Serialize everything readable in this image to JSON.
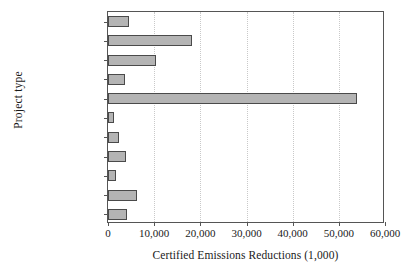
{
  "chart_data": {
    "type": "bar",
    "orientation": "horizontal",
    "title": "",
    "xlabel": "Certified Emissions Reductions (1,000)",
    "ylabel": "Project type",
    "categories": [
      "Wind",
      "N2O",
      "Landfill gas",
      "Hydro",
      "HFCs",
      "Geothermal",
      "Fugitive",
      "EE industry",
      "Cement",
      "Biomass energy",
      "Agriculture"
    ],
    "category_labels_html": [
      "Wind",
      "N<sub>2</sub>O",
      "Landfill gas",
      "Hydro",
      "HFCs",
      "Geothermal",
      "Fugitive",
      "EE industry",
      "Cement",
      "Biomass energy",
      "Agriculture"
    ],
    "values": [
      4500,
      18200,
      10300,
      3600,
      54000,
      1200,
      2300,
      3800,
      1800,
      6200,
      4100
    ],
    "xlim": [
      0,
      60000
    ],
    "xticks": [
      0,
      10000,
      20000,
      30000,
      40000,
      50000,
      60000
    ],
    "xtick_labels": [
      "0",
      "10,000",
      "20,000",
      "30,000",
      "40,000",
      "50,000",
      "60,000"
    ],
    "grid": "vertical-dotted",
    "legend": "none",
    "bar_fill_color": "#b4b4b4",
    "bar_edge_color": "#4a4a4a",
    "gridline_color": "#c9c9c9",
    "axis_color": "#555555",
    "background_color": "#ffffff"
  }
}
